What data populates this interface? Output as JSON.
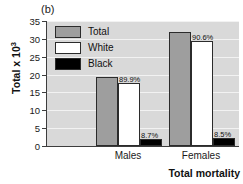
{
  "figure": {
    "panel_label": "(b)"
  },
  "chart_data": {
    "type": "bar",
    "title": "",
    "panel": "(b)",
    "xlabel": "Total mortality",
    "ylabel": "Total x 10",
    "ylabel_exponent": "3",
    "categories": [
      "Males",
      "Females"
    ],
    "ylim": [
      0,
      35
    ],
    "yticks": [
      0,
      5,
      10,
      15,
      20,
      25,
      30,
      35
    ],
    "ytick_labels": [
      "0",
      "5",
      "10",
      "15",
      "20",
      "25",
      "30",
      "35"
    ],
    "grid": true,
    "grid_orientation": "horizontal",
    "legend_position": "upper-left",
    "series": [
      {
        "name": "Total",
        "color": "#9e9e9e",
        "values": [
          19.3,
          32.0
        ],
        "data_labels": [
          "",
          ""
        ]
      },
      {
        "name": "White",
        "color": "#ffffff",
        "values": [
          17.6,
          29.4
        ],
        "data_labels": [
          "89.9%",
          "90.6%"
        ]
      },
      {
        "name": "Black",
        "color": "#000000",
        "values": [
          2.0,
          2.3
        ],
        "data_labels": [
          "8.7%",
          "8.5%"
        ]
      }
    ]
  }
}
